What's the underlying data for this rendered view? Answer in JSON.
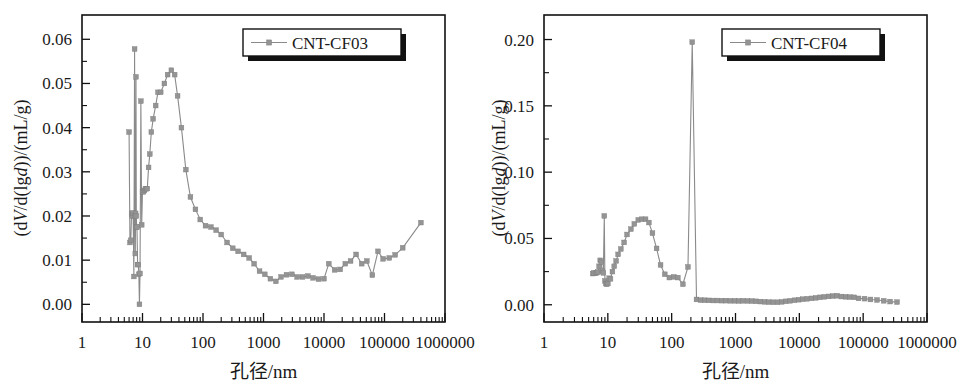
{
  "figure": {
    "panel_count": 2,
    "marker_color": "#949494",
    "line_color": "#8a8a8a",
    "axis_color": "#111111",
    "background": "#ffffff"
  },
  "chart_data": [
    {
      "type": "line",
      "title": "",
      "legend": [
        "CNT-CF03"
      ],
      "legend_position": "top-right",
      "grid": false,
      "xlabel": "孔径/nm",
      "ylabel": "(dV/d(lgd))/(mL/g)",
      "ylabel_parts": {
        "p1": "(d",
        "i1": "V",
        "p2": "/d(lg",
        "i2": "d",
        "p3": "))/(mL/g)"
      },
      "xscale": "log",
      "xlim": [
        1,
        1000000
      ],
      "ylim": [
        -0.004,
        0.0655
      ],
      "xticks": [
        1,
        10,
        100,
        1000,
        10000,
        100000,
        1000000
      ],
      "xtick_labels": [
        "1",
        "10",
        "100",
        "1000",
        "10000",
        "100000",
        "1000000"
      ],
      "yticks": [
        0.0,
        0.01,
        0.02,
        0.03,
        0.04,
        0.05,
        0.06
      ],
      "ytick_labels": [
        "0.00",
        "0.01",
        "0.02",
        "0.03",
        "0.04",
        "0.05",
        "0.06"
      ],
      "series": [
        {
          "name": "CNT-CF03",
          "x": [
            6.0,
            6.2,
            6.4,
            6.6,
            6.8,
            7.0,
            7.2,
            7.4,
            7.5,
            7.6,
            7.7,
            7.8,
            7.9,
            8.0,
            8.1,
            8.3,
            8.5,
            8.7,
            8.9,
            9.1,
            9.4,
            9.7,
            10.0,
            10.4,
            10.8,
            11.2,
            11.6,
            12.0,
            12.6,
            13.2,
            14.0,
            15.0,
            16.5,
            18.0,
            20.0,
            23.0,
            26.0,
            30.0,
            34.0,
            38.0,
            44.0,
            52.0,
            62.0,
            75.0,
            90.0,
            110.0,
            135.0,
            165.0,
            200.0,
            250.0,
            310.0,
            380.0,
            470.0,
            580.0,
            700.0,
            860.0,
            1050.0,
            1300.0,
            1600.0,
            1950.0,
            2400.0,
            2950.0,
            3600.0,
            4400.0,
            5400.0,
            6600.0,
            8100.0,
            10000.0,
            12000.0,
            15000.0,
            18500.0,
            22500.0,
            27500.0,
            34000.0,
            42000.0,
            51000.0,
            63000.0,
            78000.0,
            95000.0,
            120000.0,
            150000.0,
            200000.0,
            400000.0
          ],
          "y": [
            0.039,
            0.014,
            0.0145,
            0.0205,
            0.02,
            0.0207,
            0.0063,
            0.0578,
            0.02,
            0.0115,
            0.0206,
            0.0515,
            0.02,
            0.0175,
            0.0175,
            0.009,
            0.009,
            0.0068,
            0.0,
            0.007,
            0.046,
            0.018,
            0.0255,
            0.0255,
            0.0258,
            0.0262,
            0.0262,
            0.0262,
            0.031,
            0.034,
            0.039,
            0.042,
            0.045,
            0.048,
            0.048,
            0.05,
            0.052,
            0.053,
            0.052,
            0.0472,
            0.04,
            0.0305,
            0.0243,
            0.0215,
            0.0192,
            0.0178,
            0.0175,
            0.0168,
            0.0158,
            0.014,
            0.0127,
            0.012,
            0.0113,
            0.0105,
            0.0092,
            0.0075,
            0.0068,
            0.0058,
            0.0052,
            0.0062,
            0.0067,
            0.0068,
            0.0062,
            0.0062,
            0.0064,
            0.006,
            0.0057,
            0.0058,
            0.0092,
            0.0078,
            0.0079,
            0.0092,
            0.0098,
            0.0113,
            0.0092,
            0.0098,
            0.0066,
            0.012,
            0.0103,
            0.0105,
            0.0112,
            0.0128,
            0.0185,
            0.0005
          ]
        }
      ]
    },
    {
      "type": "line",
      "title": "",
      "legend": [
        "CNT-CF04"
      ],
      "legend_position": "top-right",
      "grid": false,
      "xlabel": "孔径/nm",
      "ylabel": "(dV/d(lgd))/(mL/g)",
      "ylabel_parts": {
        "p1": "(d",
        "i1": "V",
        "p2": "/d(lg",
        "i2": "d",
        "p3": "))/(mL/g)"
      },
      "xscale": "log",
      "xlim": [
        1,
        1000000
      ],
      "ylim": [
        -0.013,
        0.2185
      ],
      "xticks": [
        1,
        10,
        100,
        1000,
        10000,
        100000,
        1000000
      ],
      "xtick_labels": [
        "1",
        "10",
        "100",
        "1000",
        "10000",
        "100000",
        "1000000"
      ],
      "yticks": [
        0.0,
        0.05,
        0.1,
        0.15,
        0.2
      ],
      "ytick_labels": [
        "0.00",
        "0.05",
        "0.10",
        "0.15",
        "0.20"
      ],
      "series": [
        {
          "name": "CNT-CF04",
          "x": [
            5.8,
            6.1,
            6.4,
            6.7,
            7.0,
            7.3,
            7.6,
            7.9,
            8.2,
            8.5,
            8.8,
            9.0,
            9.3,
            9.6,
            10.0,
            10.5,
            11.0,
            11.8,
            12.6,
            13.5,
            14.5,
            16.0,
            18.0,
            20.0,
            23.0,
            26.0,
            30.0,
            34.0,
            39.0,
            44.0,
            50.0,
            58.0,
            67.0,
            78.0,
            92.0,
            108.0,
            125.0,
            150.0,
            180.0,
            210.0,
            245.0,
            285.0,
            330.0,
            385.0,
            450.0,
            520.0,
            610.0,
            710.0,
            830.0,
            970.0,
            1130.0,
            1320.0,
            1540.0,
            1800.0,
            2100.0,
            2450.0,
            2860.0,
            3340.0,
            3900.0,
            4550.0,
            5300.0,
            6200.0,
            7200.0,
            8400.0,
            9800.0,
            11400.0,
            13300.0,
            15500.0,
            18100.0,
            21100.0,
            24600.0,
            28700.0,
            33500.0,
            39100.0,
            45600.0,
            53200.0,
            62100.0,
            72400.0,
            84500.0,
            105000.0,
            130000.0,
            165000.0,
            210000.0,
            265000.0,
            340000.0
          ],
          "y": [
            0.0235,
            0.024,
            0.0238,
            0.0242,
            0.0248,
            0.029,
            0.0335,
            0.032,
            0.0255,
            0.024,
            0.067,
            0.018,
            0.016,
            0.0155,
            0.016,
            0.02,
            0.0195,
            0.025,
            0.029,
            0.033,
            0.038,
            0.042,
            0.047,
            0.053,
            0.057,
            0.061,
            0.064,
            0.0645,
            0.0645,
            0.062,
            0.054,
            0.0425,
            0.03,
            0.023,
            0.0205,
            0.021,
            0.0205,
            0.0155,
            0.0285,
            0.198,
            0.004,
            0.0035,
            0.0034,
            0.0033,
            0.0032,
            0.0032,
            0.0031,
            0.0031,
            0.003,
            0.003,
            0.0029,
            0.003,
            0.0029,
            0.0028,
            0.0026,
            0.0024,
            0.0022,
            0.002,
            0.0019,
            0.0019,
            0.0022,
            0.0026,
            0.003,
            0.0034,
            0.0038,
            0.0042,
            0.0045,
            0.0048,
            0.0052,
            0.0056,
            0.006,
            0.0063,
            0.0066,
            0.0068,
            0.0062,
            0.006,
            0.0058,
            0.0056,
            0.0048,
            0.0046,
            0.004,
            0.0036,
            0.003,
            0.0024,
            0.002
          ]
        }
      ]
    }
  ]
}
